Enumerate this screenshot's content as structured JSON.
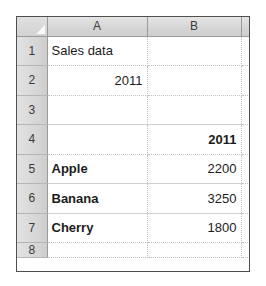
{
  "app": {
    "type": "spreadsheet",
    "select_all_icon": "select-all-triangle-icon"
  },
  "columns": {
    "headers": [
      "A",
      "B",
      "C"
    ]
  },
  "rows": {
    "headers": [
      "1",
      "2",
      "3",
      "4",
      "5",
      "6",
      "7",
      "8"
    ]
  },
  "cells": {
    "a1": "Sales data",
    "b1": "",
    "a2": "2011",
    "b2": "",
    "a3": "",
    "b3": "",
    "a4": "",
    "b4": "2011",
    "a5": "Apple",
    "b5": "2200",
    "a6": "Banana",
    "b6": "3250",
    "a7": "Cherry",
    "b7": "1800",
    "a8": "",
    "b8": ""
  },
  "chart_data": {
    "type": "table",
    "title": "Sales data",
    "year": "2011",
    "categories": [
      "Apple",
      "Banana",
      "Cherry"
    ],
    "values": [
      2200,
      3250,
      1800
    ],
    "series": [
      {
        "name": "2011",
        "values": [
          2200,
          3250,
          1800
        ]
      }
    ]
  },
  "colors": {
    "header_background": "#d9d9d9",
    "grid_line": "#c2c2c2",
    "outer_border": "#4f4f4f",
    "cell_background": "#ffffff",
    "text": "#1c1c1c"
  }
}
